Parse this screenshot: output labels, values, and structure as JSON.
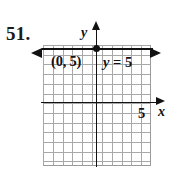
{
  "figure": {
    "problem_number": "51.",
    "axis_labels": {
      "x": "x",
      "y": "y"
    },
    "annotations": {
      "point_label": "(0, 5)",
      "equation_variable": "y",
      "equation_rest": " = 5",
      "equation_full": "y = 5",
      "x_tick_label": "5"
    },
    "colors": {
      "ink": "#111111",
      "grid": "#9a9a9a",
      "background": "#ffffff"
    }
  },
  "chart_data": {
    "type": "line",
    "title": "",
    "subtitle": "",
    "xlabel": "x",
    "ylabel": "y",
    "xlim": [
      -5.5,
      5.5
    ],
    "ylim": [
      -6.5,
      6
    ],
    "grid": true,
    "grid_step": 1,
    "legend": "none",
    "series": [
      {
        "name": "y = 5",
        "equation": "y = 5",
        "kind": "horizontal-line",
        "slope": 0,
        "intercept": 5,
        "x": [
          -5.5,
          5.5
        ],
        "values": [
          5,
          5
        ],
        "arrows": [
          "left",
          "right"
        ]
      }
    ],
    "points": [
      {
        "label": "(0, 5)",
        "x": 0,
        "y": 5,
        "marker": "filled-circle"
      }
    ],
    "annotations": [
      {
        "text": "(0, 5)",
        "x": -2.6,
        "y": 4.1
      },
      {
        "text": "y = 5",
        "x": 0.9,
        "y": 4.0
      },
      {
        "text": "5",
        "x": 4.3,
        "y": -0.7
      }
    ],
    "xticks": [
      5
    ],
    "xtick_labels": [
      "5"
    ],
    "yticks": [],
    "ytick_labels": []
  }
}
